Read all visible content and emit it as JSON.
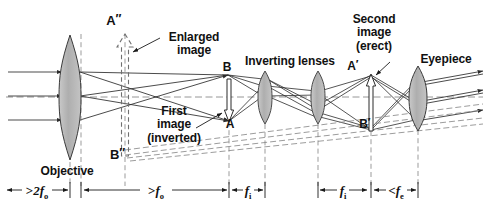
{
  "figure": {
    "width": 489,
    "height": 213,
    "background": "#ffffff",
    "ink": "#2b2b2b",
    "lens_fill": "#b6b6b6",
    "lens_stroke": "#3a3a3a",
    "dash_color": "#8a8a8a"
  },
  "labels": {
    "a_double_prime": "A",
    "a_double_prime_mark": "″",
    "enlarged_image_line1": "Enlarged",
    "enlarged_image_line2": "image",
    "b_double_prime": "B",
    "b_double_prime_mark": "″",
    "objective": "Objective",
    "first_image_line1": "First",
    "first_image_line2": "image",
    "first_image_line3": "(inverted)",
    "point_a": "A",
    "point_b": "B",
    "inverting_lenses": "Inverting lenses",
    "second_image_line1": "Second",
    "second_image_line2": "image",
    "second_image_line3": "(erect)",
    "point_a_prime": "A",
    "point_a_prime_mark": "′",
    "point_b_prime": "B",
    "point_b_prime_mark": "′",
    "eyepiece": "Eyepiece"
  },
  "dimensions": [
    {
      "id": "two-f-o",
      "prefix": ">",
      "symbol": "2f",
      "sub": "o",
      "x_start": 5,
      "x_end": 70,
      "center": 37
    },
    {
      "id": "f-o",
      "prefix": ">",
      "symbol": "f",
      "sub": "o",
      "x_start": 80,
      "x_end": 226,
      "center": 153
    },
    {
      "id": "f-i-1",
      "prefix": "",
      "symbol": "f",
      "sub": "i",
      "x_start": 231,
      "x_end": 266,
      "center": 248
    },
    {
      "id": "f-i-2",
      "prefix": "",
      "symbol": "f",
      "sub": "i",
      "x_start": 317,
      "x_end": 369,
      "center": 343
    },
    {
      "id": "f-e",
      "prefix": "<",
      "symbol": "f",
      "sub": "e",
      "x_start": 372,
      "x_end": 420,
      "center": 396
    }
  ],
  "optics": {
    "axis_y": 97,
    "lenses": [
      {
        "name": "objective",
        "x": 70,
        "half_height": 62,
        "half_width": 11
      },
      {
        "name": "inverting-lens-1",
        "x": 265,
        "half_height": 26,
        "half_width": 7
      },
      {
        "name": "inverting-lens-2",
        "x": 318,
        "half_height": 26,
        "half_width": 7
      },
      {
        "name": "eyepiece",
        "x": 418,
        "half_height": 31,
        "half_width": 8
      }
    ],
    "image_arrows": [
      {
        "name": "enlarged-image-arrow",
        "x": 125,
        "tip_y": 34,
        "tail_y": 156,
        "direction": "up",
        "style": "dashed-outline"
      },
      {
        "name": "first-image-arrow",
        "x": 229,
        "tip_y": 122,
        "tail_y": 74,
        "direction": "down",
        "style": "solid-outline"
      },
      {
        "name": "second-image-arrow",
        "x": 371,
        "tip_y": 74,
        "tail_y": 131,
        "direction": "up",
        "style": "solid-outline"
      }
    ],
    "incoming_rays_y": [
      72,
      96,
      120
    ]
  }
}
